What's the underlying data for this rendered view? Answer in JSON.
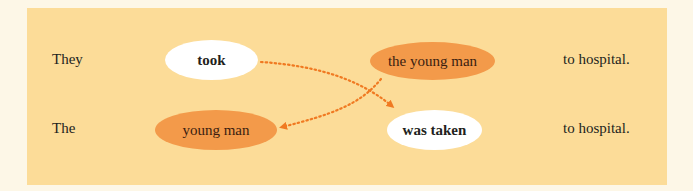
{
  "diagram": {
    "colors": {
      "page_background": "#fdf7e7",
      "panel_background": "#fcdc98",
      "verb_bubble": "#ffffff",
      "object_bubble": "#f39a4a",
      "arrow": "#f07a22"
    },
    "row1": {
      "subject": "They",
      "verb": "took",
      "object": "the young man",
      "rest": "to hospital."
    },
    "row2": {
      "subject": "The",
      "object": "young man",
      "verb": "was taken",
      "rest": "to hospital."
    },
    "arrows": [
      {
        "from": "took",
        "to": "was taken",
        "style": "dotted"
      },
      {
        "from": "the young man",
        "to": "young man",
        "style": "dotted"
      }
    ]
  }
}
